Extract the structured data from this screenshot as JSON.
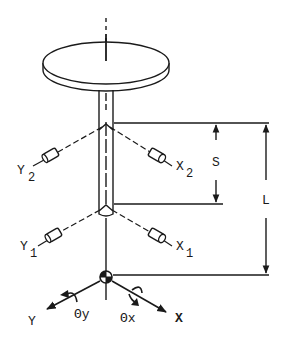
{
  "diagram": {
    "type": "mechanical-schematic",
    "ink_color": "#1a1a1a",
    "background": "#ffffff",
    "labels": {
      "sensor_y2": "Y",
      "sensor_y2_sub": "2",
      "sensor_x2": "X",
      "sensor_x2_sub": "2",
      "sensor_y1": "Y",
      "sensor_y1_sub": "1",
      "sensor_x1": "X",
      "sensor_x1_sub": "1",
      "dim_s": "S",
      "dim_l": "L",
      "axis_y": "Y",
      "axis_x": "X",
      "rot_y": "Θy",
      "rot_x": "Θx"
    }
  }
}
